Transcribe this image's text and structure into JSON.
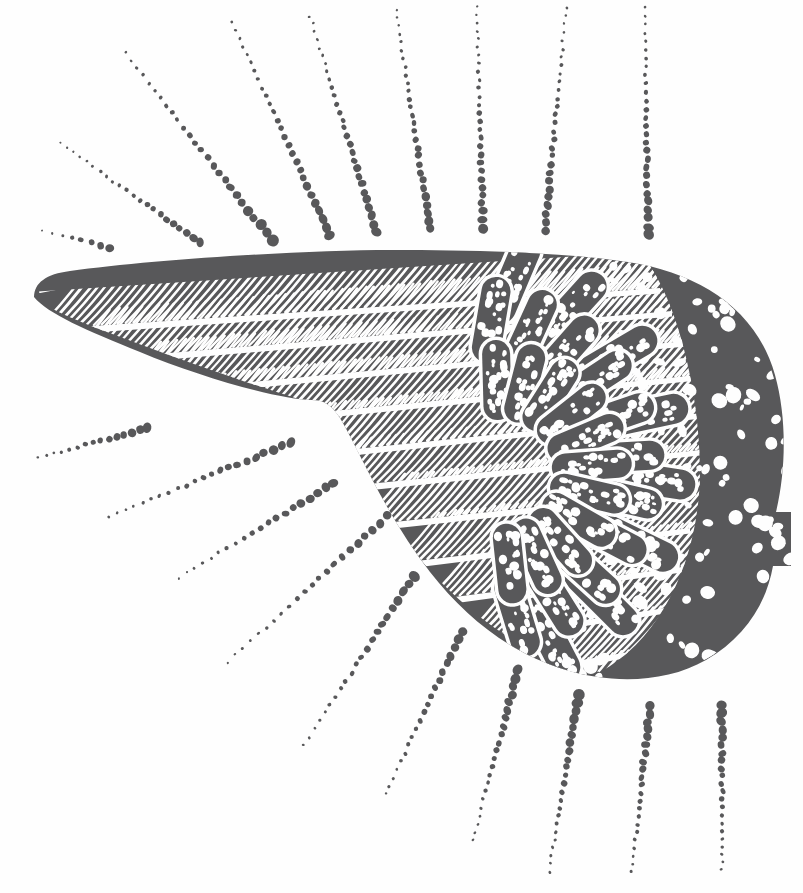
{
  "artwork": {
    "title": "Winged Wing Emblem Woodcut",
    "subject": "bird-wing",
    "style": "woodcut-linocut-engraving",
    "width": 803,
    "height": 893,
    "background_color": "#fefefe",
    "ink_color": "#58585a",
    "paper_color": "#ffffff",
    "alt_text": "A stylized woodcut illustration of a bird's left wing pointing left, with hatched primary feathers and speckled scalloped covert feathers, surrounded by radiating dotted rays."
  },
  "wing": {
    "name": "bird-wing",
    "orientation": "tip-left-body-right",
    "outline_path": "M 34 297 C 34 283 46 274 70 271 C 150 260 300 250 392 250 C 470 250 560 252 628 262 C 700 273 757 310 775 375 C 787 418 786 470 776 512 L 791 512 L 791 566 L 773 566 C 766 605 744 638 706 660 C 666 683 612 684 566 670 C 510 653 466 618 430 572 C 398 531 374 484 352 440 C 338 412 330 400 312 400 C 280 400 200 377 140 352 C 86 330 48 314 34 297 Z",
    "body_fill": "#58585a",
    "primaries": {
      "count": 11,
      "hatch_angle_deg": -28,
      "description": "Long hatched flight feather bands sweeping from the right shoulder out to the left tip"
    },
    "coverts": {
      "rows": 3,
      "per_row": [
        8,
        11,
        11
      ],
      "shape": "rounded-pill",
      "outline_color": "#fefefe",
      "fill": "#58585a",
      "speckle_color": "#fefefe",
      "description": "Overlapping scalloped covert feathers, each outlined in white and filled with white speckles"
    },
    "shoulder_speckle": {
      "description": "Dense white speckle field on the rounded shoulder at the right, with a stepped notch on the outer edge",
      "dot_count": 210,
      "dot_color": "#fefefe"
    },
    "notch": {
      "description": "Squared step notch on the trailing right edge",
      "x": 775,
      "y": 512,
      "width": 16,
      "height": 54
    }
  },
  "rays": {
    "name": "radiating-dotted-rays",
    "total": 19,
    "dot_color": "#58585a",
    "taper": "dots grow larger toward the wing, smaller toward the image edge",
    "groups": [
      {
        "group_name": "upper-left-fan",
        "count": 2,
        "items": [
          {
            "x1": 43,
            "y1": 230,
            "x2": 110,
            "y2": 248,
            "dots": 8,
            "r_near": 4.6,
            "r_far": 1.0
          },
          {
            "x1": 60,
            "y1": 143,
            "x2": 200,
            "y2": 243,
            "dots": 22,
            "r_near": 4.2,
            "r_far": 1.0
          }
        ]
      },
      {
        "group_name": "upper-fan",
        "count": 7,
        "items": [
          {
            "x1": 125,
            "y1": 53,
            "x2": 272,
            "y2": 240,
            "dots": 26,
            "r_near": 5.2,
            "r_far": 1.4
          },
          {
            "x1": 232,
            "y1": 22,
            "x2": 330,
            "y2": 236,
            "dots": 27,
            "r_near": 5.0,
            "r_far": 1.4
          },
          {
            "x1": 310,
            "y1": 16,
            "x2": 377,
            "y2": 232,
            "dots": 28,
            "r_near": 4.8,
            "r_far": 1.3
          },
          {
            "x1": 396,
            "y1": 10,
            "x2": 430,
            "y2": 229,
            "dots": 28,
            "r_near": 4.6,
            "r_far": 1.3
          },
          {
            "x1": 477,
            "y1": 6,
            "x2": 483,
            "y2": 228,
            "dots": 28,
            "r_near": 4.4,
            "r_far": 1.2
          },
          {
            "x1": 566,
            "y1": 8,
            "x2": 545,
            "y2": 230,
            "dots": 28,
            "r_near": 4.6,
            "r_far": 1.2
          },
          {
            "x1": 645,
            "y1": 8,
            "x2": 648,
            "y2": 235,
            "dots": 28,
            "r_near": 4.8,
            "r_far": 1.3
          }
        ]
      },
      {
        "group_name": "lower-left-fan",
        "count": 4,
        "items": [
          {
            "x1": 38,
            "y1": 458,
            "x2": 148,
            "y2": 428,
            "dots": 15,
            "r_near": 4.6,
            "r_far": 1.3
          },
          {
            "x1": 108,
            "y1": 517,
            "x2": 290,
            "y2": 443,
            "dots": 22,
            "r_near": 4.8,
            "r_far": 1.3
          },
          {
            "x1": 178,
            "y1": 578,
            "x2": 334,
            "y2": 483,
            "dots": 20,
            "r_near": 4.8,
            "r_far": 1.2
          },
          {
            "x1": 228,
            "y1": 662,
            "x2": 388,
            "y2": 516,
            "dots": 22,
            "r_near": 4.6,
            "r_far": 1.2
          }
        ]
      },
      {
        "group_name": "lower-fan",
        "count": 6,
        "items": [
          {
            "x1": 304,
            "y1": 745,
            "x2": 414,
            "y2": 576,
            "dots": 22,
            "r_near": 5.0,
            "r_far": 1.3
          },
          {
            "x1": 386,
            "y1": 794,
            "x2": 462,
            "y2": 631,
            "dots": 21,
            "r_near": 5.0,
            "r_far": 1.3
          },
          {
            "x1": 473,
            "y1": 840,
            "x2": 518,
            "y2": 670,
            "dots": 22,
            "r_near": 5.2,
            "r_far": 1.3
          },
          {
            "x1": 549,
            "y1": 872,
            "x2": 578,
            "y2": 695,
            "dots": 23,
            "r_near": 5.2,
            "r_far": 1.4
          },
          {
            "x1": 632,
            "y1": 872,
            "x2": 650,
            "y2": 706,
            "dots": 22,
            "r_near": 5.0,
            "r_far": 1.4
          },
          {
            "x1": 722,
            "y1": 870,
            "x2": 722,
            "y2": 706,
            "dots": 22,
            "r_near": 5.0,
            "r_far": 1.4
          }
        ]
      }
    ]
  }
}
